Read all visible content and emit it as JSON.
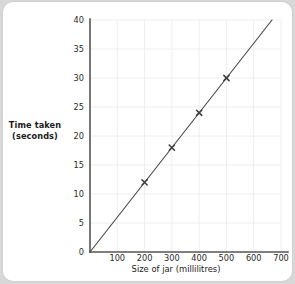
{
  "chart_data": {
    "type": "line",
    "title": "",
    "xlabel": "Size of jar (millilitres)",
    "ylabel": "Time taken (seconds)",
    "ylabel_line1": "Time taken",
    "ylabel_line2": "(seconds)",
    "xlim": [
      0,
      700
    ],
    "ylim": [
      0,
      40
    ],
    "xticks": [
      100,
      200,
      300,
      400,
      500,
      600,
      700
    ],
    "yticks": [
      0,
      5,
      10,
      15,
      20,
      25,
      30,
      35,
      40
    ],
    "xtick_labels": [
      "100",
      "200",
      "300",
      "400",
      "500",
      "600",
      "700"
    ],
    "ytick_labels": [
      "0",
      "5",
      "10",
      "15",
      "20",
      "25",
      "30",
      "35",
      "40"
    ],
    "grid": true,
    "legend": "none",
    "marker": "x-cross",
    "series": [
      {
        "name": "Time taken vs size of jar",
        "x": [
          200,
          300,
          400,
          500
        ],
        "values": [
          12,
          18,
          24,
          30
        ],
        "points": [
          {
            "x": 200,
            "y": 12
          },
          {
            "x": 300,
            "y": 18
          },
          {
            "x": 400,
            "y": 24
          },
          {
            "x": 500,
            "y": 30
          }
        ],
        "line_of_best_fit": {
          "from": {
            "x": 0,
            "y": 0
          },
          "to": {
            "x": 667,
            "y": 40
          },
          "slope": 0.06,
          "intercept": 0
        }
      }
    ],
    "colors": {
      "line": "#4a4a4a",
      "marker": "#3c3c3c",
      "axis": "#555555",
      "grid": "#ececec",
      "text": "#1b1b1b",
      "background": "#ffffff",
      "page_background": "#d8d8d8"
    }
  }
}
